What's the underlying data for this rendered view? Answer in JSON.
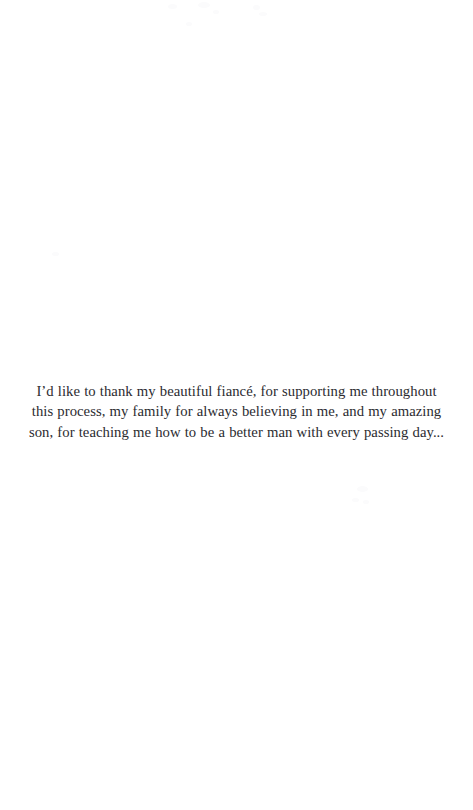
{
  "page": {
    "background_color": "#ffffff",
    "text_color": "#2b2b30"
  },
  "dedication": {
    "text": "I’d like to thank my beautiful fiancé, for supporting me throughout this process, my family for always believing in me, and my amazing son, for teaching me how to be a better man with every passing day...",
    "lines": [
      "I’d like to thank my beautiful fiancé, for supporting me throughout",
      "this process, my family for always believing in me, and my amazing",
      "son, for teaching me how to be a better man with every passing day..."
    ]
  }
}
